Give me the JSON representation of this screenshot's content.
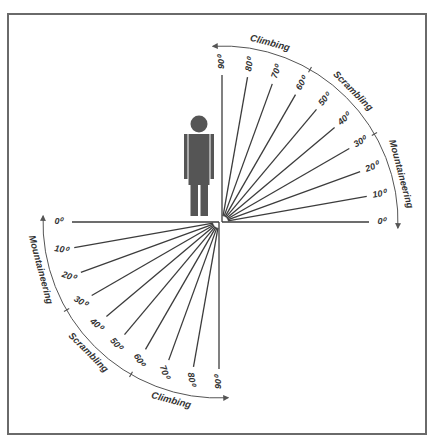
{
  "diagram": {
    "upper_fan": {
      "angles": [
        "0",
        "10",
        "20",
        "30",
        "40",
        "50",
        "60",
        "70",
        "80",
        "90"
      ],
      "degree_labels": [
        "0⁰",
        "10⁰",
        "20⁰",
        "30⁰",
        "40⁰",
        "50⁰",
        "60⁰",
        "70⁰",
        "80⁰",
        "90⁰"
      ],
      "zones": [
        {
          "label": "Mountaineering",
          "from_deg": 0,
          "to_deg": 30
        },
        {
          "label": "Scrambling",
          "from_deg": 30,
          "to_deg": 60
        },
        {
          "label": "Climbing",
          "from_deg": 60,
          "to_deg": 90
        }
      ]
    },
    "lower_fan": {
      "angles": [
        "0",
        "10",
        "20",
        "30",
        "40",
        "50",
        "60",
        "70",
        "80",
        "90"
      ],
      "degree_labels": [
        "0⁰",
        "10⁰",
        "20⁰",
        "30⁰",
        "40⁰",
        "50⁰",
        "60⁰",
        "70⁰",
        "80⁰",
        "90⁰"
      ],
      "zones": [
        {
          "label": "Mountaineering",
          "from_deg": 0,
          "to_deg": 30
        },
        {
          "label": "Scrambling",
          "from_deg": 30,
          "to_deg": 60
        },
        {
          "label": "Climbing",
          "from_deg": 60,
          "to_deg": 90
        }
      ]
    },
    "figure": "person-silhouette",
    "colors": {
      "line": "#3c3c3c",
      "figure": "#555555",
      "frame": "#6a6a6a",
      "background": "#ffffff"
    }
  }
}
